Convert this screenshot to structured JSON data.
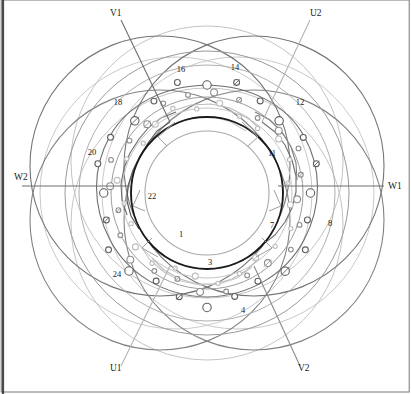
{
  "figure": {
    "background_color": "#ffffff",
    "border_color": "#555555",
    "canvas": {
      "width": 411,
      "height": 394
    },
    "center": {
      "x": 207,
      "y": 193
    }
  },
  "terminals": [
    {
      "id": "V1",
      "label": "V1",
      "label_x": 110,
      "label_y": 16,
      "lead_from": {
        "x": 121,
        "y": 20
      },
      "lead_to": {
        "x": 170,
        "y": 122
      },
      "color": "#6e6e6e"
    },
    {
      "id": "U2",
      "label": "U2",
      "label_x": 310,
      "label_y": 16,
      "lead_from": {
        "x": 310,
        "y": 20
      },
      "lead_to": {
        "x": 262,
        "y": 122
      },
      "color": "#b4b4b4"
    },
    {
      "id": "W1",
      "label": "W1",
      "label_x": 388,
      "label_y": 189,
      "lead_from": {
        "x": 384,
        "y": 186
      },
      "lead_to": {
        "x": 278,
        "y": 186
      },
      "color": "#6e6e6e"
    },
    {
      "id": "W2",
      "label": "W2",
      "label_x": 14,
      "label_y": 180,
      "lead_from": {
        "x": 22,
        "y": 186
      },
      "lead_to": {
        "x": 130,
        "y": 186
      },
      "color": "#6e6e6e"
    },
    {
      "id": "U1",
      "label": "U1",
      "label_x": 110,
      "label_y": 371,
      "lead_from": {
        "x": 121,
        "y": 366
      },
      "lead_to": {
        "x": 170,
        "y": 266
      },
      "color": "#b4b4b4"
    },
    {
      "id": "V2",
      "label": "V2",
      "label_x": 298,
      "label_y": 371,
      "lead_from": {
        "x": 300,
        "y": 366
      },
      "lead_to": {
        "x": 254,
        "y": 266
      },
      "color": "#8a8a8a"
    }
  ],
  "slot_labels": [
    {
      "number": "16",
      "x": 181,
      "y": 72
    },
    {
      "number": "14",
      "x": 235,
      "y": 70
    },
    {
      "number": "18",
      "x": 118,
      "y": 105
    },
    {
      "number": "12",
      "x": 300,
      "y": 105
    },
    {
      "number": "20",
      "x": 92,
      "y": 155
    },
    {
      "number": "11",
      "x": 272,
      "y": 156
    },
    {
      "number": "22",
      "x": 152,
      "y": 199
    },
    {
      "number": "7",
      "x": 272,
      "y": 228
    },
    {
      "number": "8",
      "x": 330,
      "y": 226
    },
    {
      "number": "1",
      "x": 181,
      "y": 237
    },
    {
      "number": "3",
      "x": 210,
      "y": 265
    },
    {
      "number": "24",
      "x": 117,
      "y": 277
    },
    {
      "number": "4",
      "x": 243,
      "y": 313
    }
  ],
  "rings": [
    {
      "name": "inner-bore-circle",
      "radius": 56,
      "color": "#a8a8a8",
      "width": 1.0
    },
    {
      "name": "stator-inner-circle",
      "radius": 62,
      "color": "#1a1a1a",
      "width": 1.8
    },
    {
      "name": "stator-outer-circle",
      "radius": 76,
      "color": "#1a1a1a",
      "width": 1.8
    }
  ],
  "phase_colors": {
    "phase_u": "#b4b4b4",
    "phase_v": "#6e6e6e",
    "phase_w": "#8a8a8a",
    "outline_dark": "#555555",
    "outline_mid": "#888888",
    "outline_light": "#bcbcbc"
  },
  "big_arcs": [
    {
      "cx": 148,
      "cy": 172,
      "r": 128,
      "color": "#6a6a6a",
      "width": 1.0
    },
    {
      "cx": 266,
      "cy": 172,
      "r": 128,
      "color": "#6a6a6a",
      "width": 1.0
    },
    {
      "cx": 148,
      "cy": 214,
      "r": 128,
      "color": "#7d7d7d",
      "width": 1.0
    },
    {
      "cx": 266,
      "cy": 214,
      "r": 128,
      "color": "#7d7d7d",
      "width": 1.0
    },
    {
      "cx": 207,
      "cy": 140,
      "r": 128,
      "color": "#a0a0a0",
      "width": 1.0
    },
    {
      "cx": 207,
      "cy": 246,
      "r": 128,
      "color": "#a0a0a0",
      "width": 1.0
    },
    {
      "cx": 176,
      "cy": 193,
      "r": 134,
      "color": "#c2c2c2",
      "width": 1.0
    },
    {
      "cx": 238,
      "cy": 193,
      "r": 134,
      "color": "#c2c2c2",
      "width": 1.0
    }
  ],
  "coil_bands": [
    {
      "name": "band-outer-dark",
      "radius": 108,
      "color": "#5f5f5f",
      "node_radius": 4.2
    },
    {
      "name": "band-mid-grey",
      "radius": 96,
      "color": "#8d8d8d",
      "node_radius": 3.4
    },
    {
      "name": "band-inner-light",
      "radius": 86,
      "color": "#bdbdbd",
      "node_radius": 3.0
    }
  ],
  "node_count_per_band": 24
}
